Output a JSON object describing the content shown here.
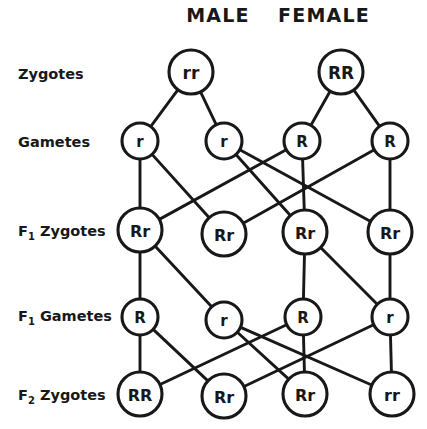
{
  "diagram": {
    "title_hidden": "",
    "column_headers": [
      {
        "label": "MALE",
        "x": 218,
        "y": 22
      },
      {
        "label": "FEMALE",
        "x": 324,
        "y": 22
      }
    ],
    "row_labels": [
      {
        "main": "Zygotes",
        "sub": "",
        "after": "",
        "x": 18,
        "y": 79
      },
      {
        "main": "Gametes",
        "sub": "",
        "after": "",
        "x": 18,
        "y": 147
      },
      {
        "main": "F",
        "sub": "1",
        "after": " Zygotes",
        "x": 18,
        "y": 236
      },
      {
        "main": "F",
        "sub": "1",
        "after": " Gametes",
        "x": 18,
        "y": 321
      },
      {
        "main": "F",
        "sub": "2",
        "after": " Zygotes",
        "x": 18,
        "y": 400
      }
    ],
    "rows": [
      {
        "name": "zygotes",
        "nodes": [
          {
            "label": "rr",
            "cx": 191,
            "cy": 72,
            "r": 22,
            "fs": 17
          },
          {
            "label": "RR",
            "cx": 341,
            "cy": 72,
            "r": 22,
            "fs": 17
          }
        ]
      },
      {
        "name": "gametes",
        "nodes": [
          {
            "label": "r",
            "cx": 140,
            "cy": 141,
            "r": 18,
            "fs": 15
          },
          {
            "label": "r",
            "cx": 224,
            "cy": 141,
            "r": 18,
            "fs": 15
          },
          {
            "label": "R",
            "cx": 302,
            "cy": 141,
            "r": 18,
            "fs": 15
          },
          {
            "label": "R",
            "cx": 390,
            "cy": 141,
            "r": 18,
            "fs": 15
          }
        ]
      },
      {
        "name": "f1-zygotes",
        "nodes": [
          {
            "label": "Rr",
            "cx": 140,
            "cy": 230,
            "r": 22,
            "fs": 16
          },
          {
            "label": "Rr",
            "cx": 224,
            "cy": 234,
            "r": 22,
            "fs": 16
          },
          {
            "label": "Rr",
            "cx": 305,
            "cy": 232,
            "r": 22,
            "fs": 16
          },
          {
            "label": "Rr",
            "cx": 390,
            "cy": 232,
            "r": 22,
            "fs": 16
          }
        ]
      },
      {
        "name": "f1-gametes",
        "nodes": [
          {
            "label": "R",
            "cx": 140,
            "cy": 317,
            "r": 18,
            "fs": 15
          },
          {
            "label": "r",
            "cx": 224,
            "cy": 320,
            "r": 18,
            "fs": 15
          },
          {
            "label": "R",
            "cx": 303,
            "cy": 317,
            "r": 18,
            "fs": 15
          },
          {
            "label": "r",
            "cx": 390,
            "cy": 317,
            "r": 18,
            "fs": 15
          }
        ]
      },
      {
        "name": "f2-zygotes",
        "nodes": [
          {
            "label": "RR",
            "cx": 140,
            "cy": 394,
            "r": 22,
            "fs": 16
          },
          {
            "label": "Rr",
            "cx": 224,
            "cy": 396,
            "r": 22,
            "fs": 16
          },
          {
            "label": "Rr",
            "cx": 305,
            "cy": 394,
            "r": 22,
            "fs": 16
          },
          {
            "label": "rr",
            "cx": 392,
            "cy": 394,
            "r": 22,
            "fs": 16
          }
        ]
      }
    ],
    "edges": [
      {
        "from": [
          0,
          0
        ],
        "to": [
          1,
          0
        ]
      },
      {
        "from": [
          0,
          0
        ],
        "to": [
          1,
          1
        ]
      },
      {
        "from": [
          0,
          1
        ],
        "to": [
          1,
          2
        ]
      },
      {
        "from": [
          0,
          1
        ],
        "to": [
          1,
          3
        ]
      },
      {
        "from": [
          1,
          0
        ],
        "to": [
          2,
          0
        ]
      },
      {
        "from": [
          1,
          0
        ],
        "to": [
          2,
          1
        ]
      },
      {
        "from": [
          1,
          1
        ],
        "to": [
          2,
          2
        ]
      },
      {
        "from": [
          1,
          1
        ],
        "to": [
          2,
          3
        ]
      },
      {
        "from": [
          1,
          2
        ],
        "to": [
          2,
          0
        ]
      },
      {
        "from": [
          1,
          2
        ],
        "to": [
          2,
          2
        ]
      },
      {
        "from": [
          1,
          3
        ],
        "to": [
          2,
          1
        ]
      },
      {
        "from": [
          1,
          3
        ],
        "to": [
          2,
          3
        ]
      },
      {
        "from": [
          2,
          0
        ],
        "to": [
          3,
          0
        ]
      },
      {
        "from": [
          2,
          0
        ],
        "to": [
          3,
          1
        ]
      },
      {
        "from": [
          2,
          2
        ],
        "to": [
          3,
          2
        ]
      },
      {
        "from": [
          2,
          2
        ],
        "to": [
          3,
          3
        ]
      },
      {
        "from": [
          2,
          3
        ],
        "to": [
          3,
          3
        ]
      },
      {
        "from": [
          3,
          0
        ],
        "to": [
          4,
          0
        ]
      },
      {
        "from": [
          3,
          0
        ],
        "to": [
          4,
          1
        ]
      },
      {
        "from": [
          3,
          1
        ],
        "to": [
          4,
          2
        ]
      },
      {
        "from": [
          3,
          1
        ],
        "to": [
          4,
          3
        ]
      },
      {
        "from": [
          3,
          2
        ],
        "to": [
          4,
          0
        ]
      },
      {
        "from": [
          3,
          2
        ],
        "to": [
          4,
          2
        ]
      },
      {
        "from": [
          3,
          3
        ],
        "to": [
          4,
          1
        ]
      },
      {
        "from": [
          3,
          3
        ],
        "to": [
          4,
          3
        ]
      }
    ],
    "colors": {
      "ink": "#18181a",
      "paper": "#ffffff"
    }
  }
}
